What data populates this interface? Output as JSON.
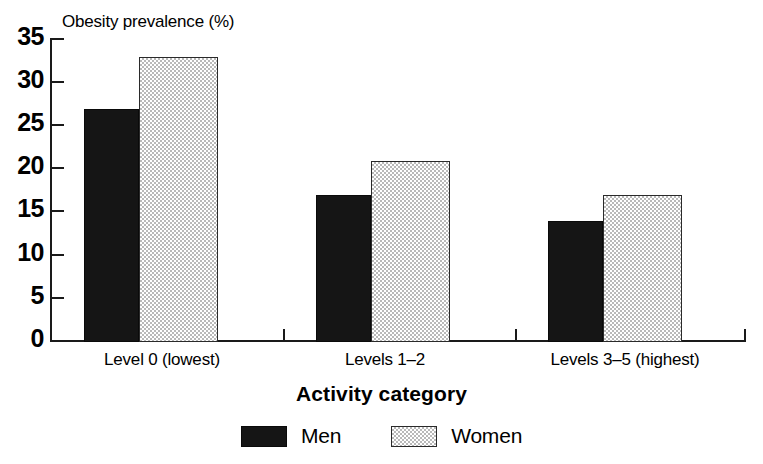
{
  "chart_data": {
    "type": "bar",
    "title": "",
    "categories": [
      "Level 0 (lowest)",
      "Levels 1–2",
      "Levels 3–5 (highest)"
    ],
    "series": [
      {
        "name": "Men",
        "values": [
          27,
          17,
          14
        ],
        "color": "#151515",
        "pattern": "solid-black"
      },
      {
        "name": "Women",
        "values": [
          33,
          21,
          17
        ],
        "color": "#d0d0d0",
        "pattern": "checkered-gray"
      }
    ],
    "xlabel": "Activity category",
    "ylabel": "Obesity prevalence (%)",
    "ylim": [
      0,
      35
    ],
    "ytick_step": 5,
    "yticks": [
      35,
      30,
      25,
      20,
      15,
      10,
      5,
      0
    ],
    "grid": false,
    "legend_position": "bottom-center"
  },
  "axes": {
    "y_axis_title": "Obesity prevalence (%)",
    "x_axis_title": "Activity category",
    "y_tick_labels": [
      "35",
      "30",
      "25",
      "20",
      "15",
      "10",
      "5",
      "0"
    ]
  },
  "legend": {
    "items": [
      {
        "label": "Men",
        "swatch": "black-solid-swatch"
      },
      {
        "label": "Women",
        "swatch": "gray-checkered-swatch"
      }
    ]
  },
  "categories": [
    {
      "label": "Level 0 (lowest)"
    },
    {
      "label": "Levels 1–2"
    },
    {
      "label": "Levels 3–5 (highest)"
    }
  ]
}
